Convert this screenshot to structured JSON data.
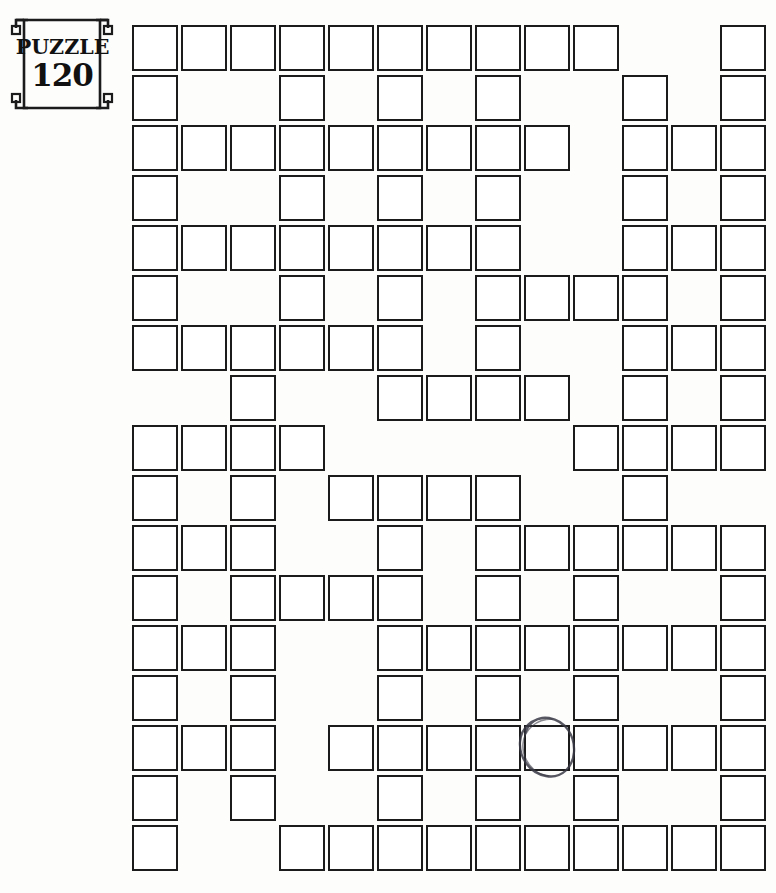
{
  "badge": {
    "word": "PUZZLE",
    "number": "120",
    "frame_color": "#1b1b1b"
  },
  "grid": {
    "columns": 13,
    "rows": 17,
    "cell_size": 46,
    "cell_pitch_x": 49,
    "cell_pitch_y": 50,
    "origin_x": 132,
    "origin_y": 25,
    "border_color": "#1b1b1b",
    "cell_fill": "#ffffff",
    "filled_cells": [
      [
        1,
        2,
        3,
        4,
        5,
        6,
        7,
        8,
        9,
        10,
        13
      ],
      [
        1,
        4,
        6,
        8,
        11,
        13
      ],
      [
        1,
        2,
        3,
        4,
        5,
        6,
        7,
        8,
        9,
        11,
        12,
        13
      ],
      [
        1,
        4,
        6,
        8,
        11,
        13
      ],
      [
        1,
        2,
        3,
        4,
        5,
        6,
        7,
        8,
        11,
        12,
        13
      ],
      [
        1,
        4,
        6,
        8,
        9,
        10,
        11,
        13
      ],
      [
        1,
        2,
        3,
        4,
        5,
        6,
        8,
        11,
        12,
        13
      ],
      [
        3,
        6,
        7,
        8,
        9,
        11,
        13
      ],
      [
        1,
        2,
        3,
        4,
        10,
        11,
        12,
        13
      ],
      [
        1,
        3,
        5,
        6,
        7,
        8,
        11
      ],
      [
        1,
        2,
        3,
        6,
        8,
        9,
        10,
        11,
        12,
        13
      ],
      [
        1,
        3,
        4,
        5,
        6,
        8,
        10,
        13
      ],
      [
        1,
        2,
        3,
        6,
        7,
        8,
        9,
        10,
        11,
        12,
        13
      ],
      [
        1,
        3,
        6,
        8,
        10,
        13
      ],
      [
        1,
        2,
        3,
        5,
        6,
        7,
        8,
        9,
        10,
        11,
        12,
        13
      ],
      [
        1,
        3,
        6,
        8,
        10,
        13
      ],
      [
        1,
        4,
        5,
        6,
        7,
        8,
        9,
        10,
        11,
        12,
        13
      ]
    ]
  },
  "annotations": {
    "circle": {
      "row": 15,
      "column": 9,
      "color": "#3a3a46",
      "label": "hand-drawn-circle"
    }
  }
}
